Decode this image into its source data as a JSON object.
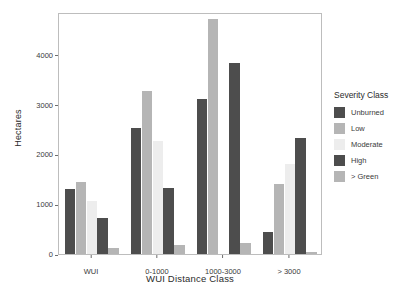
{
  "chart_data": {
    "type": "bar",
    "title": "",
    "xlabel": "WUI Distance Class",
    "ylabel": "Hectares",
    "categories": [
      "WUI",
      "0-1000",
      "1000-3000",
      "> 3000"
    ],
    "yticks": [
      0,
      1000,
      2000,
      3000,
      4000
    ],
    "ylim": [
      0,
      4850
    ],
    "grid": false,
    "legend_position": "right",
    "legend_title": "Severity Class",
    "series": [
      {
        "name": "Unburned",
        "color": "#4d4d4d",
        "values": [
          1310,
          2520,
          3100,
          440
        ]
      },
      {
        "name": "Low",
        "color": "#b5b5b5",
        "values": [
          1450,
          3270,
          4720,
          1405
        ]
      },
      {
        "name": "Moderate",
        "color": "#ededed",
        "values": [
          1060,
          2260,
          0,
          1810
        ]
      },
      {
        "name": "High",
        "color": "#4d4d4d",
        "values": [
          730,
          1330,
          3820,
          2320
        ]
      },
      {
        "name": "> Green",
        "color": "#b5b5b5",
        "values": [
          120,
          185,
          220,
          45
        ]
      }
    ]
  },
  "axes": {
    "ylabel": "Hectares",
    "xlabel": "WUI Distance Class",
    "ytick_labels": [
      "0",
      "1000",
      "2000",
      "3000",
      "4000"
    ],
    "xtick_labels": [
      "WUI",
      "0-1000",
      "1000-3000",
      "> 3000"
    ]
  },
  "legend": {
    "title": "Severity Class",
    "items": [
      {
        "label": "Unburned",
        "color": "#4d4d4d"
      },
      {
        "label": "Low",
        "color": "#b5b5b5"
      },
      {
        "label": "Moderate",
        "color": "#ededed"
      },
      {
        "label": "High",
        "color": "#4d4d4d"
      },
      {
        "label": "> Green",
        "color": "#b5b5b5"
      }
    ]
  }
}
